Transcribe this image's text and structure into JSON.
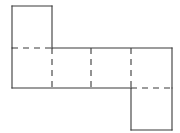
{
  "figure": {
    "kind": "geometry-net",
    "background_color": "#ffffff",
    "line_color": "#3a3a3a",
    "line_width": 1.1,
    "canvas": {
      "width": 180,
      "height": 133
    },
    "grid": {
      "columns_x": [
        12,
        52,
        91,
        131,
        172
      ],
      "rows_y": [
        6,
        48,
        88,
        130
      ],
      "cell_width": 40,
      "cell_height": 42
    },
    "faces": [
      {
        "id": "face-top-left",
        "col": 0,
        "row": 0,
        "x": 12,
        "y": 6,
        "width": 40,
        "height": 42
      },
      {
        "id": "face-row-1",
        "col": 0,
        "row": 1,
        "x": 12,
        "y": 48,
        "width": 40,
        "height": 40
      },
      {
        "id": "face-row-2",
        "col": 1,
        "row": 1,
        "x": 52,
        "y": 48,
        "width": 39,
        "height": 40
      },
      {
        "id": "face-row-3",
        "col": 2,
        "row": 1,
        "x": 91,
        "y": 48,
        "width": 40,
        "height": 40
      },
      {
        "id": "face-row-4",
        "col": 3,
        "row": 1,
        "x": 131,
        "y": 48,
        "width": 41,
        "height": 40
      },
      {
        "id": "face-bottom-right",
        "col": 3,
        "row": 2,
        "x": 131,
        "y": 88,
        "width": 41,
        "height": 42
      }
    ],
    "solid_edges": [
      {
        "id": "top-edge-upper-square",
        "x1": 12,
        "y1": 6,
        "x2": 52,
        "y2": 6
      },
      {
        "id": "left-edge-upper-square",
        "x1": 12,
        "y1": 6,
        "x2": 12,
        "y2": 48
      },
      {
        "id": "right-edge-upper-square",
        "x1": 52,
        "y1": 6,
        "x2": 52,
        "y2": 48
      },
      {
        "id": "top-edge-row",
        "x1": 52,
        "y1": 48,
        "x2": 172,
        "y2": 48
      },
      {
        "id": "left-edge-row",
        "x1": 12,
        "y1": 48,
        "x2": 12,
        "y2": 88
      },
      {
        "id": "bottom-edge-row",
        "x1": 12,
        "y1": 88,
        "x2": 131,
        "y2": 88
      },
      {
        "id": "right-edge-row",
        "x1": 172,
        "y1": 48,
        "x2": 172,
        "y2": 88
      },
      {
        "id": "left-edge-lower-square",
        "x1": 131,
        "y1": 88,
        "x2": 131,
        "y2": 130
      },
      {
        "id": "right-edge-lower-square",
        "x1": 172,
        "y1": 88,
        "x2": 172,
        "y2": 130
      },
      {
        "id": "bottom-edge-lower-square",
        "x1": 131,
        "y1": 130,
        "x2": 172,
        "y2": 130
      }
    ],
    "fold_edges": [
      {
        "id": "fold-upper-to-row",
        "x1": 12,
        "y1": 48,
        "x2": 52,
        "y2": 48
      },
      {
        "id": "fold-row-to-lower",
        "x1": 131,
        "y1": 88,
        "x2": 172,
        "y2": 88
      },
      {
        "id": "fold-vertical-col-1",
        "x1": 52,
        "y1": 48,
        "x2": 52,
        "y2": 88
      },
      {
        "id": "fold-vertical-col-2",
        "x1": 91,
        "y1": 48,
        "x2": 91,
        "y2": 88
      },
      {
        "id": "fold-vertical-col-3",
        "x1": 131,
        "y1": 48,
        "x2": 131,
        "y2": 88
      }
    ],
    "counts": {
      "faces": 6,
      "solid_edges": 10,
      "fold_edges": 5
    }
  }
}
